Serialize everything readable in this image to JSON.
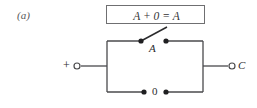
{
  "figure": {
    "part_label": "(a)",
    "identity_equation": "A + 0 = A",
    "stroke_color": "#4a4a4c",
    "border_color": "#6f6f71",
    "background_color": "#ffffff",
    "text_color": "#2b2b2d"
  },
  "circuit": {
    "type": "switching-circuit",
    "input_terminal": {
      "label": "+",
      "terminal_style": "open-circle"
    },
    "output_terminal": {
      "label": "C",
      "terminal_style": "open-circle"
    },
    "branches": [
      {
        "name": "upper-branch",
        "switch_label": "A",
        "state": "open",
        "contacts": 2
      },
      {
        "name": "lower-branch",
        "switch_label": "0",
        "state": "open-constant",
        "contacts": 2
      }
    ]
  }
}
